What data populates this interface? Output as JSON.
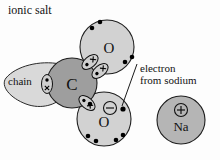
{
  "diagram": {
    "title": "ionic salt",
    "labels": {
      "chain": "chain",
      "annotation_line1": "electron",
      "annotation_line2": "from sodium"
    },
    "atoms": [
      {
        "id": "chain-fragment",
        "label": "",
        "cx": 38,
        "cy": 84,
        "r": 26,
        "fill": "#d7d7d7"
      },
      {
        "id": "carbon",
        "label": "C",
        "cx": 72,
        "cy": 83,
        "r": 25,
        "fill": "#9e9e9e"
      },
      {
        "id": "oxygen-top",
        "label": "O",
        "cx": 107,
        "cy": 47,
        "r": 27,
        "fill": "#d2d2d2"
      },
      {
        "id": "oxygen-bottom",
        "label": "O",
        "cx": 104,
        "cy": 119,
        "r": 27,
        "fill": "#d2d2d2"
      },
      {
        "id": "sodium",
        "label": "Na",
        "cx": 181,
        "cy": 120,
        "r": 24,
        "fill": "#b5b5b5"
      }
    ],
    "charges": [
      {
        "id": "oxygen-negative-charge",
        "symbol": "⊖",
        "x": 110,
        "y": 108
      },
      {
        "id": "sodium-positive-charge",
        "symbol": "⊕",
        "x": 181,
        "y": 110
      }
    ],
    "bonds": [
      {
        "id": "chain-carbon-bond",
        "type": "single",
        "x": 47,
        "y": 84,
        "angle": 90
      },
      {
        "id": "carbon-oxygen-double-bond-a",
        "type": "double",
        "x": 90,
        "y": 62,
        "angle": -40
      },
      {
        "id": "carbon-oxygen-double-bond-b",
        "type": "double",
        "x": 99,
        "y": 71,
        "angle": -40
      },
      {
        "id": "carbon-oxygen-single-bond",
        "type": "single",
        "x": 87,
        "y": 103,
        "angle": 40
      }
    ],
    "lone_pairs": [
      {
        "parent": "oxygen-top",
        "x": 92,
        "y": 28
      },
      {
        "parent": "oxygen-top",
        "x": 99,
        "y": 22
      },
      {
        "parent": "oxygen-top",
        "x": 124,
        "y": 62
      },
      {
        "parent": "oxygen-top",
        "x": 131,
        "y": 58
      },
      {
        "parent": "oxygen-bottom",
        "x": 90,
        "y": 104
      },
      {
        "parent": "oxygen-bottom",
        "x": 88,
        "y": 136
      },
      {
        "parent": "oxygen-bottom",
        "x": 95,
        "y": 140
      },
      {
        "parent": "oxygen-bottom",
        "x": 115,
        "y": 139
      },
      {
        "parent": "oxygen-bottom",
        "x": 122,
        "y": 135
      }
    ],
    "transferred_electron": {
      "id": "sodium-electron",
      "x": 124,
      "y": 110
    },
    "leader_line": {
      "x1": 137,
      "y1": 64,
      "x2": 121,
      "y2": 107
    }
  }
}
